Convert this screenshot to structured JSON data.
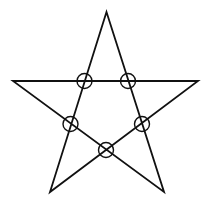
{
  "figure": {
    "stroke_color": "#111111",
    "background": "#ffffff",
    "star": {
      "points": [
        {
          "name": "top",
          "x": 106.5,
          "y": 12
        },
        {
          "name": "bottom-right",
          "x": 164,
          "y": 192
        },
        {
          "name": "left",
          "x": 13,
          "y": 81
        },
        {
          "name": "right",
          "x": 198,
          "y": 81
        },
        {
          "name": "bottom-left",
          "x": 50,
          "y": 192
        }
      ],
      "stroke_width": 1.8
    },
    "intersections": [
      {
        "name": "upper-left",
        "cx": 84.5,
        "cy": 81,
        "r": 7.5
      },
      {
        "name": "upper-right",
        "cx": 128,
        "cy": 81,
        "r": 7.5
      },
      {
        "name": "middle-left",
        "cx": 70.5,
        "cy": 124,
        "r": 7.5
      },
      {
        "name": "middle-right",
        "cx": 142,
        "cy": 124,
        "r": 7.5
      },
      {
        "name": "bottom",
        "cx": 106,
        "cy": 150,
        "r": 7.5
      }
    ],
    "circle_stroke_width": 1.4
  }
}
